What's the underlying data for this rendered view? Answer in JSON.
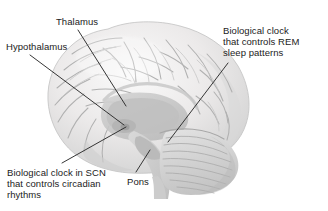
{
  "figure": {
    "image_subject": "brain-sagittal-section",
    "background_color": "#ffffff",
    "frame_border_color": "#b9b9b9"
  },
  "labels": {
    "thalamus": {
      "text": "Thalamus",
      "lines": [
        "Thalamus"
      ]
    },
    "hypothalamus": {
      "text": "Hypothalamus",
      "lines": [
        "Hypothalamus"
      ]
    },
    "rem_clock": {
      "text": "Biological clock\nthat controls REM\nsleep patterns",
      "lines": [
        "Biological clock",
        "that controls REM",
        "sleep patterns"
      ]
    },
    "scn_clock": {
      "text": "Biological clock in SCN\nthat controls circadian\nrhythms",
      "lines": [
        "Biological clock in SCN",
        "that controls circadian",
        "rhythms"
      ]
    },
    "pons": {
      "text": "Pons",
      "lines": [
        "Pons"
      ]
    }
  },
  "leader_lines": {
    "color": "#2b2b2b",
    "thalamus": {
      "from_x": 78,
      "from_y": 30,
      "to_x": 126,
      "to_y": 106
    },
    "hypothalamus": {
      "from_x": 30,
      "from_y": 55,
      "to_x": 124,
      "to_y": 125
    },
    "rem_clock": {
      "from_x": 228,
      "from_y": 63,
      "to_x": 168,
      "to_y": 142
    },
    "scn_clock": {
      "from_x": 62,
      "from_y": 163,
      "to_x": 126,
      "to_y": 127
    },
    "pons": {
      "from_x": 136,
      "from_y": 172,
      "to_x": 150,
      "to_y": 150
    }
  },
  "anatomy": {
    "regions": [
      "cerebral-cortex",
      "thalamus",
      "hypothalamus",
      "brainstem",
      "pons",
      "cerebellum",
      "spinal-cord"
    ],
    "palette": {
      "cortex_light": "#f2f2f2",
      "cortex_mid": "#e2e2e2",
      "cortex_shadow": "#cdcdcd",
      "sulcus_line": "#b5b5b5",
      "deep_structure": "#c9c9c9",
      "cerebellum": "#d6d6d6"
    }
  }
}
